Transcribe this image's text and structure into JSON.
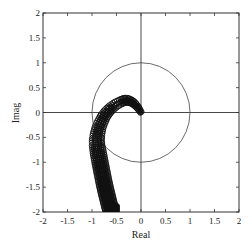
{
  "chart_data": {
    "type": "scatter",
    "title": "",
    "xlabel": "Real",
    "ylabel": "Imag",
    "xlim": [
      -2,
      2
    ],
    "ylim": [
      -2,
      2
    ],
    "grid": false,
    "legend": null,
    "x_ticks": [
      "-2",
      "-1.5",
      "-1",
      "-0.5",
      "0",
      "0.5",
      "1",
      "1.5",
      "2"
    ],
    "y_ticks": [
      "2",
      "1.5",
      "1",
      "0.5",
      "0",
      "-0.5",
      "-1",
      "-1.5",
      "-2"
    ],
    "annotations": [
      "unit circle centered at origin",
      "real axis line at Imag=0",
      "imaginary axis line at Real=0"
    ],
    "series": [
      {
        "name": "roots (dense circle markers)",
        "marker": "circle",
        "x": [
          0.0,
          -0.05,
          -0.1,
          -0.15,
          -0.2,
          -0.25,
          -0.3,
          -0.35,
          -0.4,
          -0.5,
          -0.6,
          -0.68,
          -0.75,
          -0.8,
          -0.85,
          -0.88,
          -0.9,
          -0.9,
          -0.88,
          -0.86,
          -0.84,
          -0.82,
          -0.8,
          -0.78,
          -0.76,
          -0.74,
          -0.72,
          -0.7,
          -0.68,
          -0.66,
          -0.64,
          -0.62,
          -0.6,
          -0.58,
          -0.56,
          -0.54,
          -0.52,
          -0.5,
          -0.48
        ],
        "y": [
          0.0,
          0.08,
          0.14,
          0.19,
          0.22,
          0.24,
          0.25,
          0.24,
          0.22,
          0.17,
          0.1,
          0.02,
          -0.07,
          -0.17,
          -0.28,
          -0.4,
          -0.52,
          -0.64,
          -0.76,
          -0.87,
          -0.98,
          -1.08,
          -1.18,
          -1.28,
          -1.38,
          -1.47,
          -1.56,
          -1.64,
          -1.72,
          -1.8,
          -1.88,
          -1.95,
          -2.0,
          -2.0,
          -2.0,
          -2.0,
          -2.0,
          -2.0,
          -2.0
        ]
      }
    ]
  },
  "axes": {
    "xlabel": "Real",
    "ylabel": "Imag"
  }
}
